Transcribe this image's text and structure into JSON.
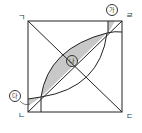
{
  "diagram": {
    "vertices": {
      "top_left": "ㄱ",
      "bottom_left": "ㄴ",
      "bottom_right": "ㄷ",
      "top_right": "ㄹ"
    },
    "regions": {
      "top_right_small": "가",
      "center_lens": "나",
      "bottom_left_small": "다"
    },
    "colors": {
      "line": "#222222",
      "shade": "#c8c8c8"
    }
  }
}
